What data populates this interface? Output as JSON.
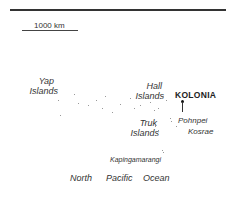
{
  "scale": {
    "label": "1000 km"
  },
  "capital": {
    "name": "KOLONIA"
  },
  "labels": {
    "yap": [
      "Yap",
      "Islands"
    ],
    "hall": [
      "Hall",
      "Islands"
    ],
    "truk": [
      "Truk",
      "Islands"
    ],
    "pohnpei": "Pohnpei",
    "kosrae": "Kosrae",
    "kapinga": "Kapingamarangi",
    "ocean": [
      "North",
      "Pacific",
      "Ocean"
    ]
  }
}
